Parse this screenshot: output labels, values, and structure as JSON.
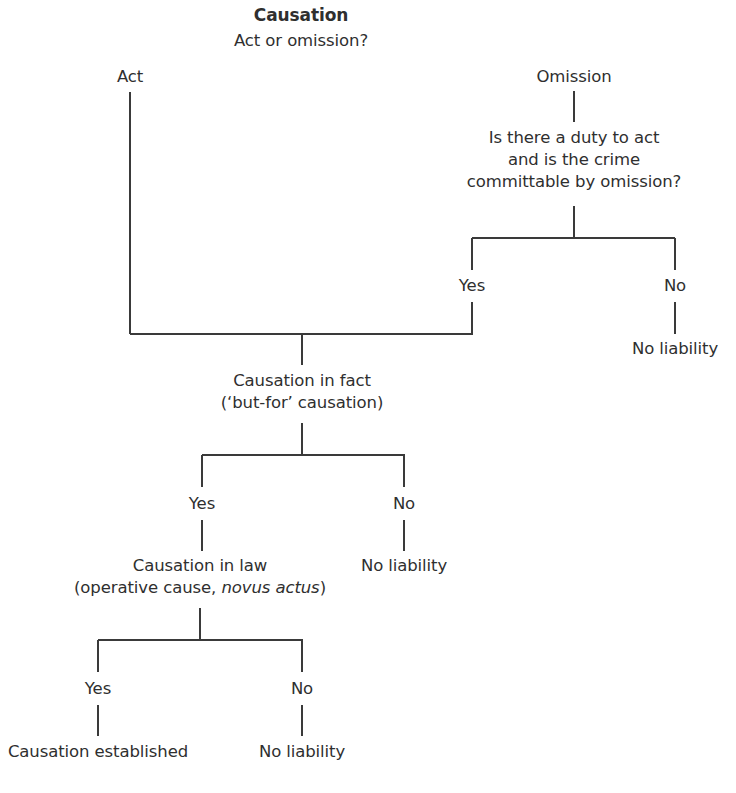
{
  "diagram": {
    "title": "Causation",
    "line_color": "#3a3a3a",
    "text_color": "#2f2f2f",
    "nodes": [
      {
        "id": "title",
        "x": 301,
        "y": 4,
        "lines": [
          [
            {
              "t": "Causation"
            }
          ]
        ],
        "cls": "title"
      },
      {
        "id": "act-or-omission",
        "x": 301,
        "y": 30,
        "lines": [
          [
            {
              "t": "Act or omission?"
            }
          ]
        ]
      },
      {
        "id": "act",
        "x": 130,
        "y": 66,
        "lines": [
          [
            {
              "t": "Act"
            }
          ]
        ]
      },
      {
        "id": "omission",
        "x": 574,
        "y": 66,
        "lines": [
          [
            {
              "t": "Omission"
            }
          ]
        ]
      },
      {
        "id": "duty-question",
        "x": 574,
        "y": 127,
        "lines": [
          [
            {
              "t": "Is there a duty to act"
            }
          ],
          [
            {
              "t": "and is the crime"
            }
          ],
          [
            {
              "t": "committable by omission?"
            }
          ]
        ]
      },
      {
        "id": "omission-yes",
        "x": 472,
        "y": 275,
        "lines": [
          [
            {
              "t": "Yes"
            }
          ]
        ]
      },
      {
        "id": "omission-no",
        "x": 675,
        "y": 275,
        "lines": [
          [
            {
              "t": "No"
            }
          ]
        ]
      },
      {
        "id": "omission-no-liability",
        "x": 675,
        "y": 338,
        "lines": [
          [
            {
              "t": "No liability"
            }
          ]
        ]
      },
      {
        "id": "causation-in-fact",
        "x": 302,
        "y": 370,
        "lines": [
          [
            {
              "t": "Causation in fact"
            }
          ],
          [
            {
              "t": "(‘but-for’ causation)"
            }
          ]
        ]
      },
      {
        "id": "fact-yes",
        "x": 202,
        "y": 493,
        "lines": [
          [
            {
              "t": "Yes"
            }
          ]
        ]
      },
      {
        "id": "fact-no",
        "x": 404,
        "y": 493,
        "lines": [
          [
            {
              "t": "No"
            }
          ]
        ]
      },
      {
        "id": "fact-no-liability",
        "x": 404,
        "y": 555,
        "lines": [
          [
            {
              "t": "No liability"
            }
          ]
        ]
      },
      {
        "id": "causation-in-law",
        "x": 200,
        "y": 555,
        "lines": [
          [
            {
              "t": "Causation in law"
            }
          ],
          [
            {
              "t": "(operative cause, "
            },
            {
              "t": "novus actus",
              "i": true
            },
            {
              "t": ")"
            }
          ]
        ]
      },
      {
        "id": "law-yes",
        "x": 98,
        "y": 678,
        "lines": [
          [
            {
              "t": "Yes"
            }
          ]
        ]
      },
      {
        "id": "law-no",
        "x": 302,
        "y": 678,
        "lines": [
          [
            {
              "t": "No"
            }
          ]
        ]
      },
      {
        "id": "causation-established",
        "x": 98,
        "y": 741,
        "lines": [
          [
            {
              "t": "Causation established"
            }
          ]
        ]
      },
      {
        "id": "law-no-liability",
        "x": 302,
        "y": 741,
        "lines": [
          [
            {
              "t": "No liability"
            }
          ]
        ]
      }
    ],
    "vlines": [
      {
        "id": "act-stem",
        "x": 130,
        "y1": 92,
        "y2": 334
      },
      {
        "id": "omission-stem",
        "x": 574,
        "y1": 91,
        "y2": 122
      },
      {
        "id": "duty-stem",
        "x": 574,
        "y1": 206,
        "y2": 238
      },
      {
        "id": "omission-yes-up",
        "x": 472,
        "y1": 238,
        "y2": 270
      },
      {
        "id": "omission-no-up",
        "x": 675,
        "y1": 238,
        "y2": 270
      },
      {
        "id": "omission-yes-down",
        "x": 472,
        "y1": 302,
        "y2": 334
      },
      {
        "id": "omission-no-down",
        "x": 675,
        "y1": 302,
        "y2": 334
      },
      {
        "id": "join-stem",
        "x": 302,
        "y1": 334,
        "y2": 365
      },
      {
        "id": "fact-stem",
        "x": 302,
        "y1": 423,
        "y2": 455
      },
      {
        "id": "fact-yes-up",
        "x": 202,
        "y1": 455,
        "y2": 487
      },
      {
        "id": "fact-no-up",
        "x": 404,
        "y1": 455,
        "y2": 487
      },
      {
        "id": "fact-yes-down",
        "x": 202,
        "y1": 520,
        "y2": 551
      },
      {
        "id": "fact-no-down",
        "x": 404,
        "y1": 520,
        "y2": 551
      },
      {
        "id": "law-stem",
        "x": 200,
        "y1": 608,
        "y2": 640
      },
      {
        "id": "law-yes-up",
        "x": 98,
        "y1": 640,
        "y2": 672
      },
      {
        "id": "law-no-up",
        "x": 302,
        "y1": 640,
        "y2": 672
      },
      {
        "id": "law-yes-down",
        "x": 98,
        "y1": 705,
        "y2": 736
      },
      {
        "id": "law-no-down",
        "x": 302,
        "y1": 705,
        "y2": 736
      }
    ],
    "hlines": [
      {
        "id": "duty-split",
        "y": 238,
        "x1": 472,
        "x2": 675
      },
      {
        "id": "act-omission-join",
        "y": 334,
        "x1": 130,
        "x2": 473
      },
      {
        "id": "fact-split",
        "y": 455,
        "x1": 202,
        "x2": 405
      },
      {
        "id": "law-split",
        "y": 640,
        "x1": 98,
        "x2": 303
      }
    ]
  }
}
